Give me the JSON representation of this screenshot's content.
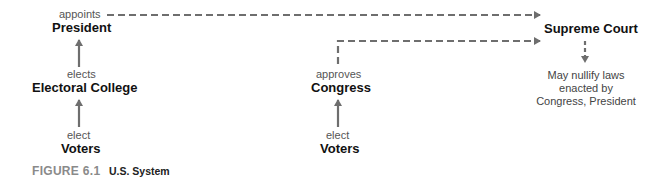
{
  "diagram": {
    "left_column": {
      "appoints_label": "appoints",
      "president": "President",
      "elects_label": "elects",
      "electoral_college": "Electoral College",
      "elect_label": "elect",
      "voters": "Voters"
    },
    "middle_column": {
      "approves_label": "approves",
      "congress": "Congress",
      "elect_label": "elect",
      "voters": "Voters"
    },
    "right_column": {
      "supreme_court": "Supreme Court",
      "note": "May nullify laws enacted by Congress, President"
    },
    "colors": {
      "arrow": "#6e6e6e",
      "caption_number": "#8a8a8a"
    }
  },
  "caption": {
    "number": "FIGURE 6.1",
    "title": "U.S. System"
  }
}
